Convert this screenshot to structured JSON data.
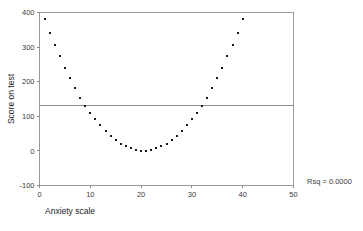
{
  "chart_data": {
    "type": "scatter",
    "title": "",
    "xlabel": "Anxiety scale",
    "ylabel": "Score on test",
    "xlim": [
      0,
      50
    ],
    "ylim": [
      -100,
      400
    ],
    "xticks": [
      0,
      10,
      20,
      30,
      40,
      50
    ],
    "yticks": [
      -100,
      0,
      100,
      200,
      300,
      400
    ],
    "xtick_labels": [
      "0",
      "10",
      "20",
      "30",
      "40",
      "50"
    ],
    "ytick_labels": [
      "-100",
      "0",
      "100",
      "200",
      "300",
      "400"
    ],
    "grid": false,
    "legend": "none",
    "marker": "square",
    "marker_color": "#1a1a1a",
    "frame_color": "#9a9a9a",
    "annotations": [
      {
        "name": "rsq-annotation",
        "text": "Rsq = 0.0000"
      }
    ],
    "reference_lines": [
      {
        "name": "linear-fit-line",
        "orientation": "horizontal",
        "y": 130,
        "color": "#8c8c8c"
      }
    ],
    "x": [
      1,
      2,
      3,
      4,
      5,
      6,
      7,
      8,
      9,
      10,
      11,
      12,
      13,
      14,
      15,
      16,
      17,
      18,
      19,
      20,
      21,
      22,
      23,
      24,
      25,
      26,
      27,
      28,
      29,
      30,
      31,
      32,
      33,
      34,
      35,
      36,
      37,
      38,
      39,
      40
    ],
    "values": [
      380,
      342,
      307,
      274,
      241,
      210,
      181,
      154,
      130,
      109,
      91,
      74,
      58,
      43,
      31,
      21,
      13,
      7,
      3,
      0,
      0,
      3,
      7,
      13,
      21,
      31,
      43,
      58,
      74,
      91,
      109,
      130,
      154,
      181,
      210,
      241,
      274,
      307,
      342,
      380
    ],
    "series": [
      {
        "name": "Score on test",
        "x": [
          1,
          2,
          3,
          4,
          5,
          6,
          7,
          8,
          9,
          10,
          11,
          12,
          13,
          14,
          15,
          16,
          17,
          18,
          19,
          20,
          21,
          22,
          23,
          24,
          25,
          26,
          27,
          28,
          29,
          30,
          31,
          32,
          33,
          34,
          35,
          36,
          37,
          38,
          39,
          40
        ],
        "values": [
          380,
          342,
          307,
          274,
          241,
          210,
          181,
          154,
          130,
          109,
          91,
          74,
          58,
          43,
          31,
          21,
          13,
          7,
          3,
          0,
          0,
          3,
          7,
          13,
          21,
          31,
          43,
          58,
          74,
          91,
          109,
          130,
          154,
          181,
          210,
          241,
          274,
          307,
          342,
          380
        ]
      }
    ]
  }
}
